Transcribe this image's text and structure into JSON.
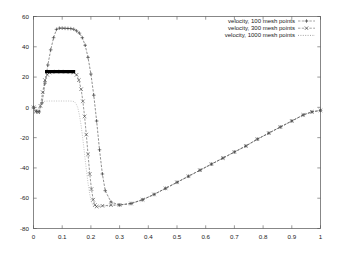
{
  "chart_data": {
    "type": "line",
    "title": "",
    "xlabel": "",
    "ylabel": "",
    "xlim": [
      0,
      1
    ],
    "ylim": [
      -80,
      60
    ],
    "grid": false,
    "legend_position": "top-right",
    "xticks": [
      "0",
      "0.1",
      "0.2",
      "0.3",
      "0.4",
      "0.5",
      "0.6",
      "0.7",
      "0.8",
      "0.9",
      "1"
    ],
    "xtick_values": [
      0,
      0.1,
      0.2,
      0.3,
      0.4,
      0.5,
      0.6,
      0.7,
      0.8,
      0.9,
      1
    ],
    "yticks": [
      "60",
      "40",
      "20",
      "0",
      "-20",
      "-40",
      "-60",
      "-80"
    ],
    "ytick_values": [
      60,
      40,
      20,
      0,
      -20,
      -40,
      -60,
      -80
    ],
    "series": [
      {
        "name": "velocity, 100 mesh points",
        "marker": "plus",
        "color": "#333333",
        "x": [
          0.0,
          0.01,
          0.02,
          0.03,
          0.04,
          0.05,
          0.06,
          0.07,
          0.08,
          0.09,
          0.1,
          0.11,
          0.12,
          0.13,
          0.14,
          0.15,
          0.16,
          0.17,
          0.18,
          0.19,
          0.2,
          0.21,
          0.22,
          0.23,
          0.24,
          0.25,
          0.27,
          0.3,
          0.34,
          0.38,
          0.42,
          0.46,
          0.5,
          0.54,
          0.58,
          0.62,
          0.66,
          0.7,
          0.74,
          0.78,
          0.82,
          0.86,
          0.9,
          0.94,
          0.97,
          1.0
        ],
        "y": [
          0.0,
          -2.5,
          -3.0,
          3.0,
          16.0,
          28.0,
          38.0,
          46.0,
          51.5,
          52.3,
          52.3,
          52.2,
          52.1,
          52.0,
          51.6,
          50.5,
          49.0,
          46.0,
          41.0,
          33.0,
          22.0,
          8.0,
          -9.0,
          -28.0,
          -44.0,
          -55.0,
          -62.5,
          -64.5,
          -63.5,
          -61.0,
          -57.5,
          -53.5,
          -49.5,
          -45.5,
          -41.5,
          -37.5,
          -33.5,
          -29.5,
          -25.5,
          -21.0,
          -17.0,
          -13.0,
          -9.0,
          -5.0,
          -3.0,
          -2.0
        ]
      },
      {
        "name": "velocity, 300 mesh points",
        "marker": "x",
        "color": "#444444",
        "x": [
          0.0,
          0.008,
          0.016,
          0.024,
          0.032,
          0.04,
          0.048,
          0.056,
          0.064,
          0.08,
          0.096,
          0.112,
          0.128,
          0.14,
          0.15,
          0.158,
          0.166,
          0.172,
          0.178,
          0.184,
          0.19,
          0.196,
          0.202,
          0.208,
          0.214,
          0.22,
          0.24,
          0.27,
          0.3,
          0.34,
          0.38,
          0.42,
          0.46,
          0.5,
          0.54,
          0.58,
          0.62,
          0.66,
          0.7,
          0.74,
          0.78,
          0.82,
          0.86,
          0.9,
          0.94,
          0.97,
          1.0
        ],
        "y": [
          0.0,
          -2.8,
          -3.2,
          1.0,
          10.0,
          18.0,
          21.5,
          23.0,
          23.5,
          23.6,
          23.6,
          23.5,
          23.4,
          23.0,
          21.5,
          18.0,
          12.0,
          4.0,
          -6.0,
          -18.0,
          -31.0,
          -44.0,
          -54.0,
          -61.0,
          -64.5,
          -65.5,
          -65.0,
          -64.6,
          -64.4,
          -63.5,
          -61.0,
          -57.5,
          -53.5,
          -49.5,
          -45.5,
          -41.5,
          -37.5,
          -33.5,
          -29.5,
          -25.5,
          -21.0,
          -17.0,
          -13.0,
          -9.0,
          -5.0,
          -3.0,
          -2.0
        ]
      },
      {
        "name": "velocity, 1000 mesh points",
        "marker": "none",
        "color": "#888888",
        "x": [
          0.0,
          0.006,
          0.012,
          0.018,
          0.024,
          0.03,
          0.036,
          0.042,
          0.06,
          0.08,
          0.1,
          0.12,
          0.134,
          0.142,
          0.148,
          0.154,
          0.16,
          0.166,
          0.172,
          0.178,
          0.184,
          0.19,
          0.196,
          0.202,
          0.208,
          0.214,
          0.22,
          0.24,
          0.27,
          0.3,
          0.34,
          0.38,
          0.42,
          0.46,
          0.5,
          0.54,
          0.58,
          0.62,
          0.66,
          0.7,
          0.74,
          0.78,
          0.82,
          0.86,
          0.9,
          0.94,
          0.97,
          1.0
        ],
        "y": [
          0.0,
          -2.6,
          -3.0,
          -1.0,
          1.5,
          3.2,
          3.9,
          4.1,
          4.2,
          4.2,
          4.2,
          4.2,
          4.1,
          3.8,
          2.5,
          0.0,
          -5.0,
          -12.0,
          -21.0,
          -31.0,
          -41.0,
          -50.0,
          -57.5,
          -62.5,
          -65.0,
          -66.0,
          -66.2,
          -65.5,
          -64.8,
          -64.4,
          -63.5,
          -61.0,
          -57.5,
          -53.5,
          -49.5,
          -45.5,
          -41.5,
          -37.5,
          -33.5,
          -29.5,
          -25.5,
          -21.0,
          -17.0,
          -13.0,
          -9.0,
          -5.0,
          -3.0,
          -2.0
        ]
      }
    ],
    "annotations": [
      {
        "name": "thick-plateau-bar",
        "description": "thick black horizontal segment",
        "x_start": 0.04,
        "x_end": 0.145,
        "y": 23.6
      }
    ]
  },
  "legend": {
    "entries": [
      {
        "label": "velocity, 100 mesh points",
        "marker": "+"
      },
      {
        "label": "velocity, 300 mesh points",
        "marker": "x"
      },
      {
        "label": "velocity, 1000 mesh points",
        "marker": ""
      }
    ]
  }
}
